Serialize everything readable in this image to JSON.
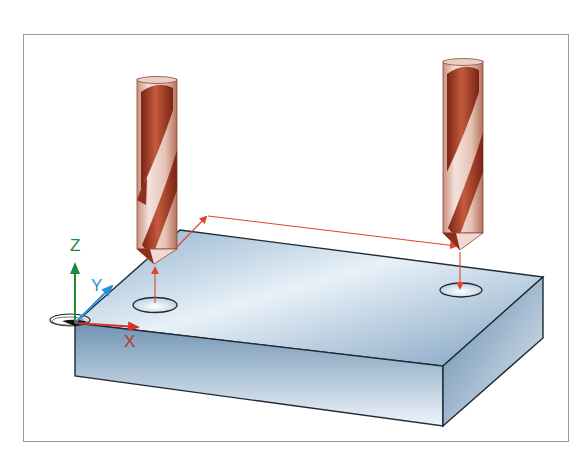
{
  "figure": {
    "axes": {
      "x_label": "X",
      "y_label": "Y",
      "z_label": "Z",
      "colors": {
        "x": "#d9302a",
        "y": "#2b8fd6",
        "z": "#1e8a3a"
      }
    },
    "tools": [
      {
        "name": "drill-left",
        "position": "above first hole"
      },
      {
        "name": "drill-right",
        "position": "above second hole"
      }
    ],
    "holes": 2,
    "colors": {
      "drill": "#9c3a24",
      "path": "#e0442e",
      "workpiece": "#a9c4dc",
      "frame": "#9a9a9a"
    }
  }
}
